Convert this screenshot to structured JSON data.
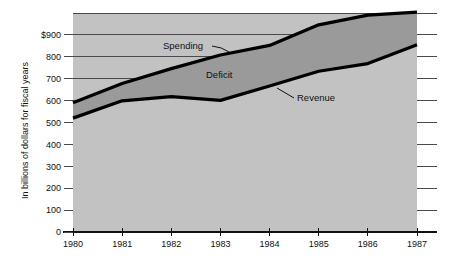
{
  "chart_data": {
    "type": "area",
    "title": "",
    "xlabel": "",
    "ylabel": "In billions of dollars for fiscal years",
    "categories": [
      "1980",
      "1981",
      "1982",
      "1983",
      "1984",
      "1985",
      "1986",
      "1987"
    ],
    "x": [
      1980,
      1981,
      1982,
      1983,
      1984,
      1985,
      1986,
      1987
    ],
    "xlim": [
      1980,
      1987
    ],
    "ylim": [
      0,
      1000
    ],
    "y_ticks": [
      0,
      100,
      200,
      300,
      400,
      500,
      600,
      700,
      800,
      900
    ],
    "y_tick_labels": [
      "0",
      "100",
      "200",
      "300",
      "400",
      "500",
      "600",
      "700",
      "800",
      "$900"
    ],
    "grid": true,
    "legend_position": "inline-annotations",
    "series": [
      {
        "name": "Spending",
        "values": [
          590,
          678,
          746,
          808,
          852,
          946,
          990,
          1004
        ]
      },
      {
        "name": "Revenue",
        "values": [
          520,
          599,
          618,
          601,
          667,
          734,
          769,
          855
        ]
      }
    ],
    "fills": [
      {
        "name": "Deficit",
        "between": [
          "Spending",
          "Revenue"
        ],
        "color": "#9a9a9a"
      },
      {
        "name": "Revenue area",
        "between": [
          "Revenue",
          "baseline"
        ],
        "color": "#c2c2c2"
      }
    ],
    "annotations": [
      {
        "label": "Spending",
        "target_year": 1983.2,
        "target_value": 815
      },
      {
        "label": "Deficit",
        "target_year": 1982.8,
        "target_value": 745
      },
      {
        "label": "Revenue",
        "target_year": 1984.6,
        "target_value": 700
      }
    ],
    "colors": {
      "plot_background": "#c2c2c2",
      "deficit_fill": "#9a9a9a",
      "line": "#000000",
      "gridline": "#4a4a4a",
      "page_background": "#ffffff"
    }
  }
}
